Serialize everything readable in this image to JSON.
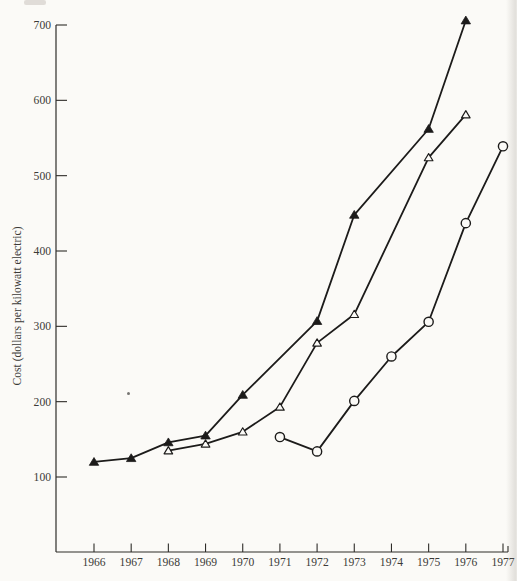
{
  "paper": {
    "background": "#fbfaf7",
    "ink": "#1c1b1a",
    "label_color": "#3c3a37"
  },
  "chart_data": {
    "type": "line",
    "title": "",
    "xlabel": "",
    "ylabel": "Cost (dollars per kilowatt electric)",
    "grid": false,
    "legend": "none",
    "x_ticks": [
      1966,
      1967,
      1968,
      1969,
      1970,
      1971,
      1972,
      1973,
      1974,
      1975,
      1976,
      1977
    ],
    "y_ticks": [
      100,
      200,
      300,
      400,
      500,
      600,
      700
    ],
    "xlim": [
      1965,
      1977.15
    ],
    "ylim": [
      0,
      720
    ],
    "series": [
      {
        "name": "filled-triangle-series",
        "marker": "filled-triangle",
        "points": [
          [
            1966,
            120
          ],
          [
            1967,
            125
          ],
          [
            1968,
            146
          ],
          [
            1969,
            155
          ],
          [
            1970,
            209
          ],
          [
            1972,
            307
          ],
          [
            1973,
            448
          ],
          [
            1975,
            562
          ],
          [
            1976,
            706
          ]
        ]
      },
      {
        "name": "open-triangle-series",
        "marker": "open-triangle",
        "points": [
          [
            1968,
            135
          ],
          [
            1969,
            144
          ],
          [
            1970,
            160
          ],
          [
            1971,
            193
          ],
          [
            1972,
            278
          ],
          [
            1973,
            316
          ],
          [
            1975,
            524
          ],
          [
            1976,
            581
          ]
        ]
      },
      {
        "name": "open-circle-series",
        "marker": "open-circle",
        "points": [
          [
            1971,
            153
          ],
          [
            1972,
            134
          ],
          [
            1973,
            201
          ],
          [
            1974,
            260
          ],
          [
            1975,
            306
          ],
          [
            1976,
            437
          ],
          [
            1977,
            539
          ]
        ]
      }
    ]
  }
}
